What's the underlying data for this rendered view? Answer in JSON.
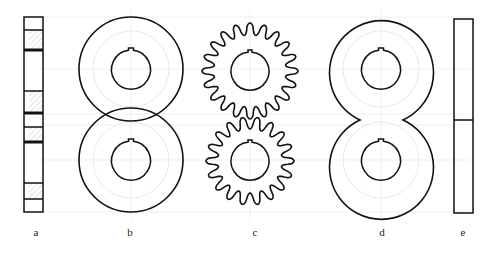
{
  "figure": {
    "labels": [
      "a",
      "b",
      "c",
      "d",
      "e"
    ],
    "panels": [
      {
        "id": "a",
        "description": "side section strip with hatched bands",
        "label": "a"
      },
      {
        "id": "b",
        "description": "two overlapping circular discs with keyed bores",
        "label": "b"
      },
      {
        "id": "c",
        "description": "two meshing spur gears with keyed bores",
        "label": "c"
      },
      {
        "id": "d",
        "description": "figure-eight merged disc outline with two keyed bores",
        "label": "d"
      },
      {
        "id": "e",
        "description": "side view rectangle split in two",
        "label": "e"
      }
    ],
    "colors": {
      "stroke": "#111111",
      "construction": "#dddddd",
      "hatch": "#bbbbbb"
    }
  }
}
